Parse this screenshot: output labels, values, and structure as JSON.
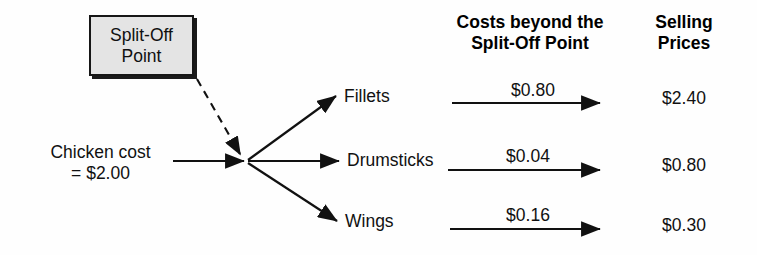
{
  "diagram": {
    "background_color": "#fefefe",
    "line_color": "#111111"
  },
  "callout": {
    "name": "split-off-point-box",
    "text": "Split-Off\nPoint",
    "fill_color": "#e4e4e4",
    "border_color": "#161616"
  },
  "source": {
    "name": "chicken-cost",
    "text": "Chicken cost\n= $2.00",
    "amount": "$2.00"
  },
  "headers": {
    "costs": "Costs beyond the\nSplit-Off Point",
    "prices": "Selling\nPrices"
  },
  "products": [
    {
      "name": "fillets",
      "label": "Fillets",
      "cost_beyond_split_off": "$0.80",
      "selling_price": "$2.40"
    },
    {
      "name": "drumsticks",
      "label": "Drumsticks",
      "cost_beyond_split_off": "$0.04",
      "selling_price": "$0.80"
    },
    {
      "name": "wings",
      "label": "Wings",
      "cost_beyond_split_off": "$0.16",
      "selling_price": "$0.30"
    }
  ]
}
